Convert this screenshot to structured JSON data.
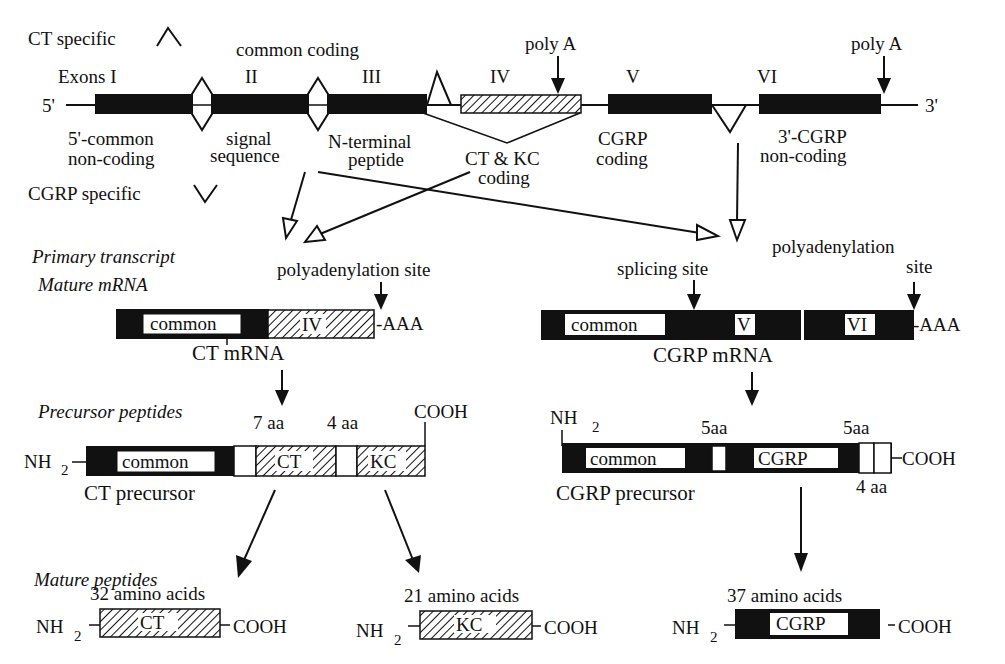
{
  "legend": {
    "ct_specific": "CT specific",
    "cgrp_specific": "CGRP specific"
  },
  "gene": {
    "five_prime": "5'",
    "three_prime": "3'",
    "common_coding": "common coding",
    "exons": [
      {
        "id": "I",
        "label": "Exons I",
        "type": "solid",
        "desc": [
          "5'-common",
          "non-coding"
        ]
      },
      {
        "id": "II",
        "label": "II",
        "type": "solid",
        "desc": [
          "signal",
          "sequence"
        ]
      },
      {
        "id": "III",
        "label": "III",
        "type": "solid",
        "desc": [
          "N-terminal",
          "peptide"
        ]
      },
      {
        "id": "IV",
        "label": "IV",
        "type": "hatched",
        "desc": [
          "CT & KC",
          "coding"
        ]
      },
      {
        "id": "V",
        "label": "V",
        "type": "solid",
        "desc": [
          "CGRP",
          "coding"
        ]
      },
      {
        "id": "VI",
        "label": "VI",
        "type": "solid",
        "desc": [
          "3'-CGRP",
          "non-coding"
        ]
      }
    ],
    "poly_a_1": "poly A",
    "poly_a_2": "poly A"
  },
  "section_labels": {
    "primary_transcript": "Primary transcript",
    "mature_mrna": "Mature mRNA",
    "precursor_peptides": "Precursor peptides",
    "mature_peptides": "Mature peptides"
  },
  "ct_mrna": {
    "polyadenylation_site": "polyadenylation site",
    "common": "common",
    "exon": "IV",
    "tail": "-AAA",
    "name": "CT mRNA"
  },
  "cgrp_mrna": {
    "splicing_site": "splicing site",
    "polyadenylation_site_1": "polyadenylation",
    "polyadenylation_site_2": "site",
    "common": "common",
    "exon_v": "V",
    "exon_vi": "VI",
    "tail": "-AAA",
    "name": "CGRP mRNA"
  },
  "ct_precursor": {
    "nh2": "NH",
    "sub2": "2",
    "common": "common",
    "seg_7aa": "7 aa",
    "ct": "CT",
    "seg_4aa": "4 aa",
    "kc": "KC",
    "cooh": "COOH",
    "name": "CT precursor"
  },
  "cgrp_precursor": {
    "nh2": "NH",
    "sub2": "2",
    "common": "common",
    "seg_5aa_1": "5aa",
    "cgrp": "CGRP",
    "seg_5aa_2": "5aa",
    "seg_4aa": "4 aa",
    "cooh": "COOH",
    "name": "CGRP precursor"
  },
  "mature_peptides": [
    {
      "name": "CT",
      "length": "32 amino acids",
      "nh2": "NH",
      "sub2": "2",
      "cooh": "COOH",
      "style": "hatched"
    },
    {
      "name": "KC",
      "length": "21 amino acids",
      "nh2": "NH",
      "sub2": "2",
      "cooh": "COOH",
      "style": "hatched"
    },
    {
      "name": "CGRP",
      "length": "37 amino acids",
      "nh2": "NH",
      "sub2": "2",
      "cooh": "COOH",
      "style": "solid"
    }
  ]
}
